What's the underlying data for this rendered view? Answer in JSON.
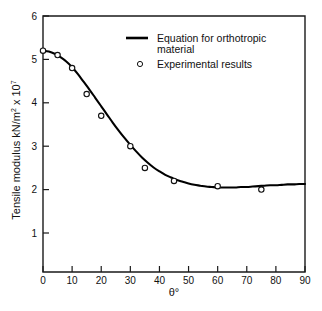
{
  "chart_data": {
    "type": "line",
    "title": "",
    "subtitle": "",
    "xlabel": "θ°",
    "ylabel": "Tensile modulus kN/m² x 10⁷",
    "ylabel_parts": {
      "main": "Tensile modulus  kN/m",
      "sup1": "2",
      "mid": " x 10",
      "sup2": "7"
    },
    "xlim": [
      0,
      90
    ],
    "ylim": [
      0,
      6
    ],
    "y_axis_visible_min": 1,
    "grid": false,
    "legend_position": "top-right-inside",
    "xticks": [
      0,
      10,
      20,
      30,
      40,
      50,
      60,
      70,
      80,
      90
    ],
    "xtick_labels": [
      "0",
      "10",
      "20",
      "30",
      "40",
      "50",
      "60",
      "70",
      "80",
      "90"
    ],
    "yticks": [
      1,
      2,
      3,
      4,
      5,
      6
    ],
    "ytick_labels": [
      "1",
      "2",
      "3",
      "4",
      "5",
      "6"
    ],
    "series": [
      {
        "name": "Equation for orthotropic material",
        "type": "line",
        "marker": "none",
        "color": "#000000",
        "x": [
          0,
          2,
          4,
          6,
          8,
          10,
          12,
          14,
          16,
          18,
          20,
          22,
          24,
          26,
          28,
          30,
          32,
          34,
          36,
          38,
          40,
          42,
          44,
          46,
          48,
          50,
          52,
          54,
          56,
          58,
          60,
          62,
          64,
          66,
          68,
          70,
          72,
          74,
          76,
          78,
          80,
          82,
          84,
          86,
          88,
          90
        ],
        "values": [
          5.2,
          5.18,
          5.13,
          5.05,
          4.95,
          4.82,
          4.66,
          4.48,
          4.3,
          4.11,
          3.92,
          3.73,
          3.54,
          3.36,
          3.19,
          3.03,
          2.88,
          2.74,
          2.62,
          2.51,
          2.42,
          2.34,
          2.28,
          2.22,
          2.18,
          2.14,
          2.11,
          2.09,
          2.07,
          2.06,
          2.05,
          2.05,
          2.05,
          2.05,
          2.06,
          2.06,
          2.07,
          2.08,
          2.09,
          2.1,
          2.1,
          2.11,
          2.12,
          2.12,
          2.13,
          2.13
        ]
      },
      {
        "name": "Experimental results",
        "type": "scatter",
        "marker": "circle-open",
        "color": "#111111",
        "x": [
          0,
          5,
          10,
          15,
          20,
          30,
          35,
          45,
          60,
          75
        ],
        "values": [
          5.2,
          5.1,
          4.8,
          4.2,
          3.7,
          3.0,
          2.5,
          2.2,
          2.08,
          2.0
        ]
      }
    ],
    "legend": [
      {
        "label": "Equation for orthotropic",
        "label2": "material",
        "marker": "line"
      },
      {
        "label": "Experimental results",
        "label2": "",
        "marker": "circle-open"
      }
    ]
  }
}
